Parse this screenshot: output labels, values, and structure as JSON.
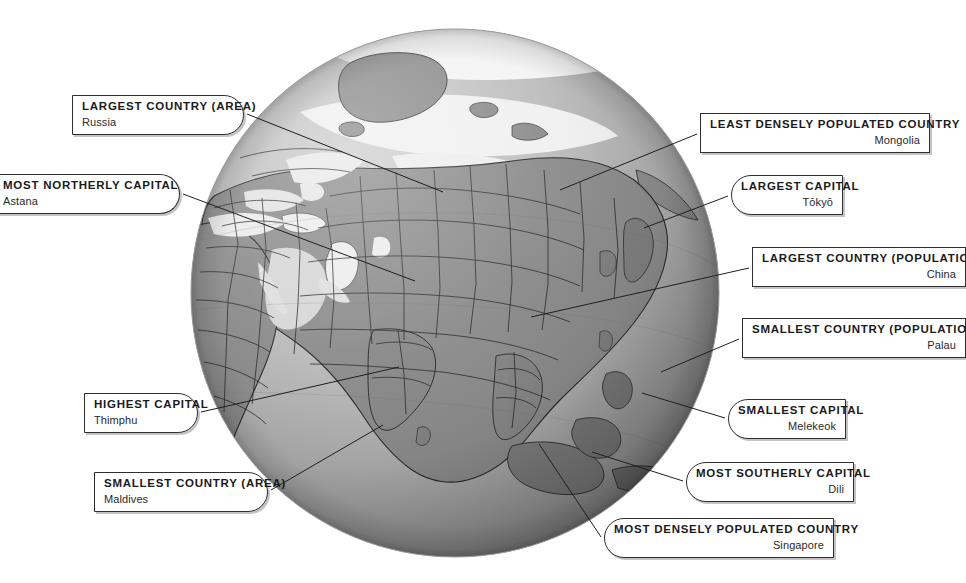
{
  "page": {
    "background_color": "#ffffff",
    "width": 966,
    "height": 583
  },
  "globe": {
    "name": "asia-centred-globe",
    "center_x": 455,
    "center_y": 293,
    "radius": 264,
    "ocean_color": "#b6b6b6",
    "land_color": "#8e8e8e",
    "ice_color": "#f2f2f2",
    "border_color": "#262626",
    "shadow_color": "#4a4a4a",
    "highlight_color": "#d7d7d7"
  },
  "callouts": [
    {
      "id": "largest-country-area",
      "title": "LARGEST COUNTRY (AREA)",
      "value": "Russia",
      "align": "left",
      "shape": "round-right",
      "x": 72,
      "y": 95,
      "w": 172
    },
    {
      "id": "most-northerly-capital",
      "title": "MOST NORTHERLY CAPITAL",
      "value": "Astana",
      "align": "left",
      "shape": "clip-left",
      "x": -6,
      "y": 174,
      "w": 186
    },
    {
      "id": "highest-capital",
      "title": "HIGHEST CAPITAL",
      "value": "Thimphu",
      "align": "left",
      "shape": "round-right",
      "x": 84,
      "y": 393,
      "w": 114
    },
    {
      "id": "smallest-country-area",
      "title": "SMALLEST COUNTRY (AREA)",
      "value": "Maldives",
      "align": "left",
      "shape": "round-right",
      "x": 94,
      "y": 472,
      "w": 174
    },
    {
      "id": "least-densely-populated-country",
      "title": "LEAST DENSELY POPULATED COUNTRY",
      "value": "Mongolia",
      "align": "right",
      "shape": "clip-right",
      "x": 700,
      "y": 113,
      "w": 230
    },
    {
      "id": "largest-capital",
      "title": "LARGEST CAPITAL",
      "value": "Tōkyō",
      "align": "right",
      "shape": "round-left",
      "x": 731,
      "y": 175,
      "w": 112
    },
    {
      "id": "largest-country-population",
      "title": "LARGEST COUNTRY (POPULATION)",
      "value": "China",
      "align": "right",
      "shape": "clip-right",
      "x": 752,
      "y": 247,
      "w": 214
    },
    {
      "id": "smallest-country-population",
      "title": "SMALLEST COUNTRY (POPULATION)",
      "value": "Palau",
      "align": "right",
      "shape": "clip-right",
      "x": 742,
      "y": 318,
      "w": 224
    },
    {
      "id": "smallest-capital",
      "title": "SMALLEST CAPITAL",
      "value": "Melekeok",
      "align": "right",
      "shape": "round-left",
      "x": 728,
      "y": 399,
      "w": 118
    },
    {
      "id": "most-southerly-capital",
      "title": "MOST SOUTHERLY CAPITAL",
      "value": "Dili",
      "align": "right",
      "shape": "round-left",
      "x": 686,
      "y": 462,
      "w": 168
    },
    {
      "id": "most-densely-populated-country",
      "title": "MOST DENSELY POPULATED COUNTRY",
      "value": "Singapore",
      "align": "right",
      "shape": "round-left",
      "x": 604,
      "y": 518,
      "w": 230
    }
  ],
  "connectors": [
    {
      "id": "connector-largest-country-area",
      "x1": 247,
      "y1": 114,
      "x2": 443,
      "y2": 192
    },
    {
      "id": "connector-most-northerly-capital",
      "x1": 183,
      "y1": 194,
      "x2": 415,
      "y2": 281
    },
    {
      "id": "connector-highest-capital",
      "x1": 201,
      "y1": 412,
      "x2": 399,
      "y2": 367
    },
    {
      "id": "connector-smallest-country-area",
      "x1": 271,
      "y1": 490,
      "x2": 383,
      "y2": 425
    },
    {
      "id": "connector-least-densely-populated-country",
      "x1": 697,
      "y1": 134,
      "x2": 560,
      "y2": 190
    },
    {
      "id": "connector-largest-capital",
      "x1": 728,
      "y1": 196,
      "x2": 644,
      "y2": 228
    },
    {
      "id": "connector-largest-country-population",
      "x1": 749,
      "y1": 268,
      "x2": 531,
      "y2": 317
    },
    {
      "id": "connector-smallest-country-population",
      "x1": 739,
      "y1": 339,
      "x2": 661,
      "y2": 372
    },
    {
      "id": "connector-smallest-capital",
      "x1": 725,
      "y1": 418,
      "x2": 642,
      "y2": 393
    },
    {
      "id": "connector-most-southerly-capital",
      "x1": 683,
      "y1": 481,
      "x2": 592,
      "y2": 452
    },
    {
      "id": "connector-most-densely-populated-country",
      "x1": 601,
      "y1": 537,
      "x2": 539,
      "y2": 444
    }
  ]
}
